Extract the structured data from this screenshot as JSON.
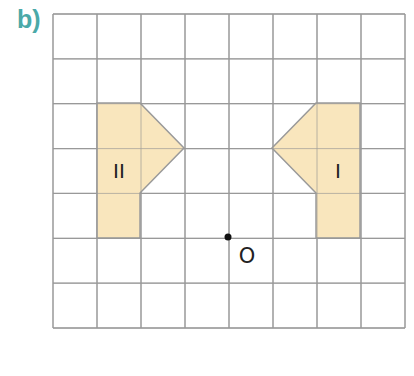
{
  "exercise_label": "b)",
  "grid": {
    "x0": 53,
    "y0": 14,
    "cols": 8,
    "rows": 7,
    "cell_w": 44,
    "cell_h": 44.86,
    "line_color": "#9a9a9a"
  },
  "colors": {
    "shape_fill": "#f9e4b7",
    "shape_stroke": "#9a9a9a",
    "label": "#4aa9a8"
  },
  "shapes": [
    {
      "label": "II",
      "points": "97,103 140,103 184,148 140,193 140,238 97,238",
      "label_x": 119,
      "label_y": 178
    },
    {
      "label": "I",
      "points": "316,103 360,103 360,238 316,238 316,193 272,148",
      "label_x": 338,
      "label_y": 178
    }
  ],
  "point": {
    "label": "O",
    "x": 228,
    "y": 237,
    "label_x": 247,
    "label_y": 263
  }
}
